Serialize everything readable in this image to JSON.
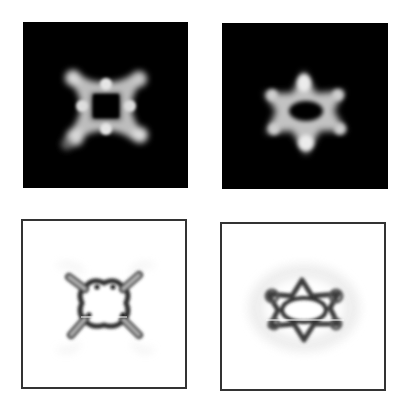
{
  "figure": {
    "panels": [
      {
        "id": "a",
        "position": "top-left",
        "style": "dark",
        "shape": "four-fold cross / X shape",
        "label": ""
      },
      {
        "id": "b",
        "position": "top-right",
        "style": "dark",
        "shape": "six-point star / hexagonal ring",
        "label": ""
      },
      {
        "id": "c",
        "position": "bottom-left",
        "style": "light",
        "shape": "four-fold cross / X shape (inverted)",
        "label": ""
      },
      {
        "id": "d",
        "position": "bottom-right",
        "style": "light",
        "shape": "six-point star (inverted)",
        "label": ""
      }
    ],
    "colors": {
      "dark_bg": "#000000",
      "light_bg": "#ffffff",
      "border": "#333333",
      "glow": "#e8e8e8"
    }
  }
}
